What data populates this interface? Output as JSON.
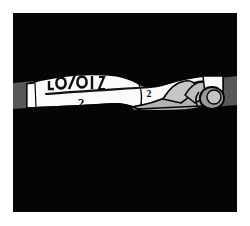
{
  "artwork": {
    "title": "Comic panel: hand gripping a banner with a fraction",
    "medium": "black and white line illustration",
    "panel": {
      "background_color": "#050505",
      "margin_color": "#ffffff",
      "border_color": "#050505",
      "x": 13,
      "y": 13,
      "width": 224,
      "height": 199
    },
    "palette": {
      "black": "#050505",
      "white": "#fbfbfb",
      "paper_white": "#ffffff",
      "hand_gray": "#b4b4b4",
      "hand_shadow_gray": "#9a9a9a",
      "edge_block_gray": "#585858",
      "line_black": "#101010"
    },
    "elements": [
      {
        "name": "banner-band",
        "description": "horizontal white ribbon crossing the panel with a wavy twist in the middle",
        "fill": "#fbfbfb",
        "stroke": "#050505"
      },
      {
        "name": "left-edge-block",
        "description": "dark gray block at the left edge of the band",
        "fill": "#585858"
      },
      {
        "name": "right-edge-block",
        "description": "dark gray block at the right edge of the band",
        "fill": "#585858"
      },
      {
        "name": "hand-fist",
        "description": "gray hand making a fist gripping the right end of the banner",
        "fill": "#b4b4b4",
        "stroke": "#050505"
      },
      {
        "name": "thumb-grip",
        "description": "rounded thumb and fingertip wrapping the banner end",
        "fill": "#9a9a9a",
        "stroke": "#050505"
      }
    ],
    "inscription": {
      "numerator": "1",
      "fraction_bar": "———",
      "denominator": "2",
      "trailing_mark": "2",
      "raw_glyphs": "[ ? ] / 2      2",
      "note": "handwritten fraction on the banner, numerator clipped by the top edge of the band"
    }
  }
}
